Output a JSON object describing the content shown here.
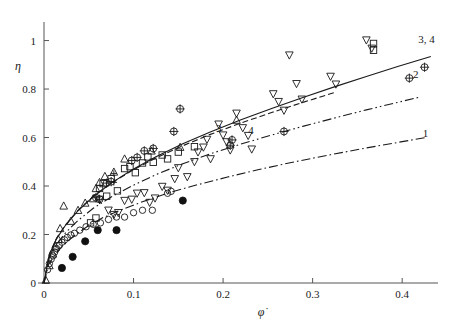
{
  "figure": {
    "background": "#ffffff",
    "ink_color": "#1a1a1a",
    "width": 450,
    "height": 321
  },
  "chart_data": {
    "type": "scatter",
    "title": "",
    "subtitle": "",
    "xlabel": "φ̇",
    "ylabel": "η",
    "xlim": [
      0,
      0.44
    ],
    "ylim": [
      0,
      1.06
    ],
    "grid": false,
    "legend_position": "inline-curve-labels",
    "xticks": [
      0,
      0.1,
      0.2,
      0.3,
      0.4
    ],
    "xtick_labels": [
      "0",
      "0.1",
      "0.2",
      "0.3",
      "0.4"
    ],
    "yticks": [
      0,
      0.2,
      0.4,
      0.6,
      0.8,
      1
    ],
    "ytick_labels": [
      "0",
      "0.2",
      "0.4",
      "0.6",
      "0.8",
      "1"
    ],
    "annotations": [
      {
        "text": "3, 4",
        "x": 0.418,
        "y": 1.005
      },
      {
        "text": "2",
        "x": 0.412,
        "y": 0.862
      },
      {
        "text": "1",
        "x": 0.423,
        "y": 0.617
      },
      {
        "text": "3",
        "x": 0.192,
        "y": 0.64
      },
      {
        "text": "4",
        "x": 0.228,
        "y": 0.63
      }
    ],
    "curves": [
      {
        "name": "curve-1",
        "label": "1",
        "style": "dash-dot",
        "points": [
          [
            0.0,
            0.0
          ],
          [
            0.005,
            0.075
          ],
          [
            0.012,
            0.115
          ],
          [
            0.02,
            0.15
          ],
          [
            0.032,
            0.19
          ],
          [
            0.048,
            0.232
          ],
          [
            0.065,
            0.268
          ],
          [
            0.085,
            0.3
          ],
          [
            0.11,
            0.335
          ],
          [
            0.14,
            0.373
          ],
          [
            0.17,
            0.404
          ],
          [
            0.205,
            0.437
          ],
          [
            0.24,
            0.468
          ],
          [
            0.28,
            0.5
          ],
          [
            0.32,
            0.529
          ],
          [
            0.36,
            0.557
          ],
          [
            0.4,
            0.583
          ],
          [
            0.425,
            0.599
          ]
        ]
      },
      {
        "name": "curve-2",
        "label": "2",
        "style": "dash-dot-dot",
        "points": [
          [
            0.0,
            0.0
          ],
          [
            0.006,
            0.105
          ],
          [
            0.014,
            0.16
          ],
          [
            0.024,
            0.207
          ],
          [
            0.038,
            0.258
          ],
          [
            0.055,
            0.308
          ],
          [
            0.075,
            0.355
          ],
          [
            0.098,
            0.4
          ],
          [
            0.125,
            0.447
          ],
          [
            0.155,
            0.492
          ],
          [
            0.185,
            0.532
          ],
          [
            0.22,
            0.573
          ],
          [
            0.255,
            0.611
          ],
          [
            0.29,
            0.647
          ],
          [
            0.325,
            0.681
          ],
          [
            0.36,
            0.714
          ],
          [
            0.395,
            0.745
          ],
          [
            0.42,
            0.767
          ]
        ]
      },
      {
        "name": "curve-3",
        "label": "3",
        "style": "dashed",
        "points": [
          [
            0.0,
            0.0
          ],
          [
            0.006,
            0.12
          ],
          [
            0.014,
            0.185
          ],
          [
            0.024,
            0.24
          ],
          [
            0.038,
            0.3
          ],
          [
            0.055,
            0.358
          ],
          [
            0.075,
            0.412
          ],
          [
            0.098,
            0.463
          ],
          [
            0.125,
            0.516
          ],
          [
            0.155,
            0.566
          ],
          [
            0.185,
            0.612
          ],
          [
            0.22,
            0.66
          ],
          [
            0.255,
            0.704
          ],
          [
            0.29,
            0.746
          ],
          [
            0.325,
            0.786
          ]
        ]
      },
      {
        "name": "curve-4",
        "label": "4",
        "style": "solid",
        "points": [
          [
            0.0,
            0.0
          ],
          [
            0.006,
            0.118
          ],
          [
            0.014,
            0.182
          ],
          [
            0.024,
            0.238
          ],
          [
            0.038,
            0.298
          ],
          [
            0.055,
            0.356
          ],
          [
            0.075,
            0.412
          ],
          [
            0.098,
            0.466
          ],
          [
            0.125,
            0.521
          ],
          [
            0.155,
            0.574
          ],
          [
            0.185,
            0.622
          ],
          [
            0.22,
            0.673
          ],
          [
            0.255,
            0.721
          ],
          [
            0.29,
            0.766
          ],
          [
            0.325,
            0.81
          ],
          [
            0.36,
            0.852
          ],
          [
            0.395,
            0.893
          ],
          [
            0.42,
            0.921
          ],
          [
            0.432,
            0.934
          ]
        ]
      }
    ],
    "series": [
      {
        "name": "open-circle",
        "marker": "circle-open",
        "points": [
          [
            0.004,
            0.055
          ],
          [
            0.006,
            0.08
          ],
          [
            0.008,
            0.098
          ],
          [
            0.01,
            0.112
          ],
          [
            0.012,
            0.128
          ],
          [
            0.014,
            0.142
          ],
          [
            0.017,
            0.155
          ],
          [
            0.02,
            0.168
          ],
          [
            0.023,
            0.178
          ],
          [
            0.026,
            0.188
          ],
          [
            0.03,
            0.198
          ],
          [
            0.034,
            0.205
          ],
          [
            0.04,
            0.218
          ],
          [
            0.047,
            0.232
          ],
          [
            0.055,
            0.242
          ],
          [
            0.063,
            0.248
          ],
          [
            0.072,
            0.262
          ],
          [
            0.081,
            0.272
          ],
          [
            0.09,
            0.272
          ],
          [
            0.1,
            0.29
          ],
          [
            0.11,
            0.3
          ],
          [
            0.121,
            0.3
          ],
          [
            0.138,
            0.37
          ],
          [
            0.142,
            0.378
          ]
        ]
      },
      {
        "name": "filled-circle",
        "marker": "circle-filled",
        "points": [
          [
            0.02,
            0.062
          ],
          [
            0.032,
            0.108
          ],
          [
            0.046,
            0.172
          ],
          [
            0.06,
            0.218
          ],
          [
            0.081,
            0.218
          ],
          [
            0.155,
            0.34
          ]
        ]
      },
      {
        "name": "up-triangle",
        "marker": "triangle-up-open",
        "points": [
          [
            0.002,
            0.012
          ],
          [
            0.006,
            0.072
          ],
          [
            0.01,
            0.12
          ],
          [
            0.013,
            0.15
          ],
          [
            0.016,
            0.18
          ],
          [
            0.018,
            0.225
          ],
          [
            0.022,
            0.318
          ],
          [
            0.03,
            0.255
          ],
          [
            0.038,
            0.3
          ],
          [
            0.046,
            0.33
          ],
          [
            0.055,
            0.348
          ],
          [
            0.058,
            0.39
          ],
          [
            0.062,
            0.415
          ],
          [
            0.068,
            0.44
          ],
          [
            0.078,
            0.458
          ],
          [
            0.09,
            0.512
          ],
          [
            0.12,
            0.545
          ],
          [
            0.152,
            0.56
          ],
          [
            0.215,
            0.672
          ]
        ]
      },
      {
        "name": "down-triangle",
        "marker": "triangle-down-open",
        "points": [
          [
            0.062,
            0.345
          ],
          [
            0.072,
            0.3
          ],
          [
            0.078,
            0.282
          ],
          [
            0.083,
            0.29
          ],
          [
            0.09,
            0.34
          ],
          [
            0.098,
            0.345
          ],
          [
            0.104,
            0.37
          ],
          [
            0.112,
            0.372
          ],
          [
            0.118,
            0.332
          ],
          [
            0.124,
            0.35
          ],
          [
            0.132,
            0.398
          ],
          [
            0.138,
            0.382
          ],
          [
            0.146,
            0.43
          ],
          [
            0.15,
            0.475
          ],
          [
            0.16,
            0.438
          ],
          [
            0.168,
            0.5
          ],
          [
            0.172,
            0.54
          ],
          [
            0.178,
            0.56
          ],
          [
            0.182,
            0.592
          ],
          [
            0.186,
            0.512
          ],
          [
            0.195,
            0.655
          ],
          [
            0.2,
            0.61
          ],
          [
            0.204,
            0.582
          ],
          [
            0.208,
            0.548
          ],
          [
            0.215,
            0.7
          ],
          [
            0.222,
            0.64
          ],
          [
            0.228,
            0.608
          ],
          [
            0.232,
            0.552
          ],
          [
            0.256,
            0.78
          ],
          [
            0.262,
            0.748
          ],
          [
            0.268,
            0.712
          ],
          [
            0.274,
            0.94
          ],
          [
            0.282,
            0.822
          ],
          [
            0.288,
            0.758
          ],
          [
            0.32,
            0.852
          ],
          [
            0.326,
            0.82
          ],
          [
            0.36,
            1.002
          ],
          [
            0.366,
            0.968
          ]
        ]
      },
      {
        "name": "square-open",
        "marker": "square-open",
        "points": [
          [
            0.052,
            0.248
          ],
          [
            0.058,
            0.268
          ],
          [
            0.062,
            0.39
          ],
          [
            0.066,
            0.41
          ],
          [
            0.07,
            0.358
          ],
          [
            0.075,
            0.43
          ],
          [
            0.082,
            0.38
          ],
          [
            0.09,
            0.472
          ],
          [
            0.096,
            0.48
          ],
          [
            0.102,
            0.455
          ],
          [
            0.11,
            0.495
          ],
          [
            0.116,
            0.52
          ],
          [
            0.122,
            0.498
          ],
          [
            0.132,
            0.528
          ],
          [
            0.138,
            0.512
          ],
          [
            0.15,
            0.54
          ],
          [
            0.168,
            0.562
          ],
          [
            0.368,
            0.96
          ],
          [
            0.368,
            0.988
          ]
        ]
      },
      {
        "name": "crossed-circle",
        "marker": "circle-crossed",
        "points": [
          [
            0.058,
            0.352
          ],
          [
            0.062,
            0.345
          ],
          [
            0.07,
            0.412
          ],
          [
            0.075,
            0.418
          ],
          [
            0.098,
            0.505
          ],
          [
            0.104,
            0.518
          ],
          [
            0.112,
            0.545
          ],
          [
            0.122,
            0.555
          ],
          [
            0.145,
            0.625
          ],
          [
            0.152,
            0.718
          ],
          [
            0.208,
            0.568
          ],
          [
            0.21,
            0.59
          ],
          [
            0.268,
            0.625
          ],
          [
            0.408,
            0.845
          ],
          [
            0.425,
            0.89
          ]
        ]
      },
      {
        "name": "plus",
        "marker": "plus",
        "points": [
          [
            0.078,
            0.452
          ],
          [
            0.078,
            0.415
          ]
        ]
      }
    ]
  }
}
